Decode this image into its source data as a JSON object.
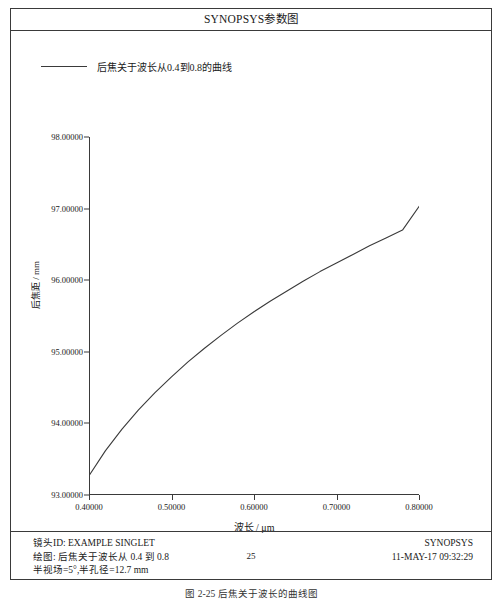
{
  "window": {
    "title": "SYNOPSYS参数图"
  },
  "legend": {
    "label": "后焦关于波长从0.4到0.8的曲线",
    "line_color": "#3a3a3a"
  },
  "axis": {
    "ylabel": "后焦距 / mm",
    "xlabel": "波长 / μm"
  },
  "footer": {
    "lens_id": "镜头ID: EXAMPLE SINGLET",
    "plot_desc": "绘图: 后焦关于波长从 0.4 到 0.8",
    "field": "半视场=5°,半孔径=12.7 mm",
    "page_number": "25",
    "brand": "SYNOPSYS",
    "timestamp": "11-MAY-17  09:32:29"
  },
  "caption": "图 2-25  后焦关于波长的曲线图",
  "chart_data": {
    "type": "line",
    "title": "SYNOPSYS参数图",
    "xlabel": "波长 / μm",
    "ylabel": "后焦距 / mm",
    "xlim": [
      0.4,
      0.8
    ],
    "ylim": [
      93.0,
      98.0
    ],
    "xticks": [
      "0.40000",
      "0.50000",
      "0.60000",
      "0.70000",
      "0.80000"
    ],
    "xtick_values": [
      0.4,
      0.5,
      0.6,
      0.7,
      0.8
    ],
    "yticks": [
      "93.00000",
      "94.00000",
      "95.00000",
      "96.00000",
      "97.00000",
      "98.00000"
    ],
    "ytick_values": [
      93.0,
      94.0,
      95.0,
      96.0,
      97.0,
      98.0
    ],
    "grid": false,
    "legend_position": "top-left",
    "series": [
      {
        "name": "后焦关于波长从0.4到0.8的曲线",
        "color": "#3a3a3a",
        "x": [
          0.4,
          0.42,
          0.44,
          0.46,
          0.48,
          0.5,
          0.52,
          0.54,
          0.56,
          0.58,
          0.6,
          0.62,
          0.64,
          0.66,
          0.68,
          0.7,
          0.72,
          0.74,
          0.76,
          0.78,
          0.8
        ],
        "y": [
          93.27,
          93.62,
          93.92,
          94.19,
          94.43,
          94.65,
          94.86,
          95.05,
          95.23,
          95.4,
          95.56,
          95.71,
          95.85,
          95.99,
          96.12,
          96.24,
          96.36,
          96.48,
          96.59,
          96.7,
          97.03
        ]
      }
    ]
  }
}
